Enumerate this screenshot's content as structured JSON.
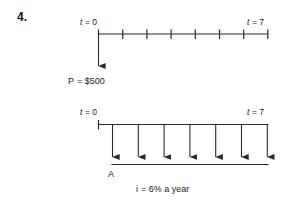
{
  "problem": {
    "number": "4."
  },
  "diagram_top": {
    "label_start": "t = 0",
    "label_start_symbol": "t",
    "label_start_value": "= 0",
    "label_end": "t = 7",
    "label_end_symbol": "t",
    "label_end_value": "= 7",
    "cash_flow_label": "P = $500",
    "cash_flow_symbol": "P",
    "cash_flow_value": "= $500",
    "periods": 7,
    "arrow_direction": "down",
    "arrow_count": 1
  },
  "diagram_bottom": {
    "label_start": "t = 0",
    "label_start_symbol": "t",
    "label_start_value": "= 0",
    "label_end": "t = 7",
    "label_end_symbol": "t",
    "label_end_value": "= 7",
    "cash_flow_label": "A",
    "periods": 7,
    "arrow_direction": "down",
    "arrow_count": 7
  },
  "interest": {
    "text": "i = 6% a year",
    "symbol": "i",
    "value": "= 6% a year",
    "rate": "6%",
    "period": "a year"
  },
  "colors": {
    "ink": "#2b2b2b",
    "text": "#1a1a1a",
    "background": "#ffffff"
  }
}
